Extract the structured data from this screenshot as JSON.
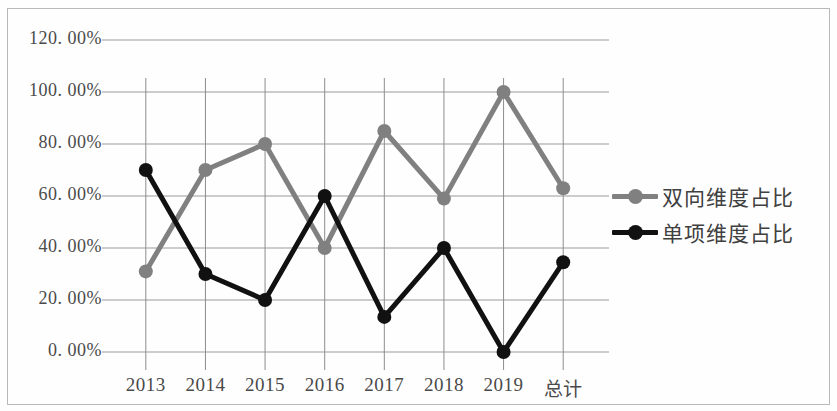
{
  "chart_data": {
    "type": "line",
    "title": "",
    "xlabel": "",
    "ylabel": "",
    "categories": [
      "2013",
      "2014",
      "2015",
      "2016",
      "2017",
      "2018",
      "2019",
      "总计"
    ],
    "series": [
      {
        "name": "双向维度占比",
        "color": "#808080",
        "values": [
          31.0,
          70.0,
          80.0,
          40.0,
          85.0,
          59.0,
          100.0,
          63.0
        ]
      },
      {
        "name": "单项维度占比",
        "color": "#111111",
        "values": [
          70.0,
          30.0,
          20.0,
          60.0,
          13.5,
          40.0,
          0.0,
          34.5
        ]
      }
    ],
    "ylim": [
      0,
      120
    ],
    "ytick_values": [
      0,
      20,
      40,
      60,
      80,
      100,
      120
    ],
    "ytick_labels": [
      "0. 00%",
      "20. 00%",
      "40. 00%",
      "60. 00%",
      "80. 00%",
      "100. 00%",
      "120. 00%"
    ],
    "grid": true,
    "grid_axis": "both",
    "grid_color": "#9a9a9a",
    "legend_position": "right",
    "marker": "circle",
    "drop_lines": true
  },
  "legend": {
    "items": [
      {
        "label": "双向维度占比",
        "color": "#808080"
      },
      {
        "label": "单项维度占比",
        "color": "#111111"
      }
    ]
  },
  "colors": {
    "series_gray": "#808080",
    "series_black": "#111111",
    "grid": "#9a9a9a",
    "frame": "#b9b9b9",
    "text": "#4a4a4a",
    "background": "#fefefe"
  }
}
